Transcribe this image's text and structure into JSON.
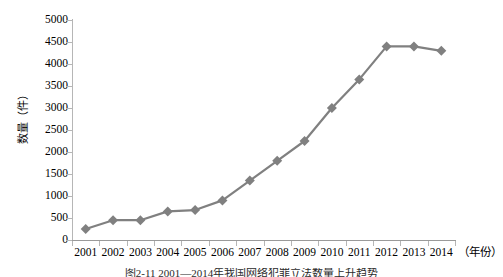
{
  "chart_data": {
    "type": "line",
    "title": "",
    "xlabel": "（年份）",
    "ylabel": "数量（件）",
    "categories": [
      "2001",
      "2002",
      "2003",
      "2004",
      "2005",
      "2006",
      "2007",
      "2008",
      "2009",
      "2010",
      "2011",
      "2012",
      "2013",
      "2014"
    ],
    "values": [
      250,
      450,
      450,
      650,
      680,
      900,
      1350,
      1800,
      2250,
      3000,
      3650,
      4400,
      4400,
      4300
    ],
    "series": [
      {
        "name": "数量",
        "values": [
          250,
          450,
          450,
          650,
          680,
          900,
          1350,
          1800,
          2250,
          3000,
          3650,
          4400,
          4400,
          4300
        ]
      }
    ],
    "ylim": [
      0,
      5000
    ],
    "ytick_labels": [
      "0",
      "500",
      "1000",
      "1500",
      "2000",
      "2500",
      "3000",
      "3500",
      "4000",
      "4500",
      "5000"
    ],
    "ytick_values": [
      0,
      500,
      1000,
      1500,
      2000,
      2500,
      3000,
      3500,
      4000,
      4500,
      5000
    ],
    "ytick_step": 500,
    "grid": false,
    "legend": "none",
    "marker": "diamond",
    "series_color": "#808080",
    "axis_color": "#b6b6b6",
    "line_width": 2.2,
    "marker_size": 5
  },
  "caption": {
    "text": "图2-11 2001—2014年我国网络犯罪立法数量上升趋势"
  }
}
